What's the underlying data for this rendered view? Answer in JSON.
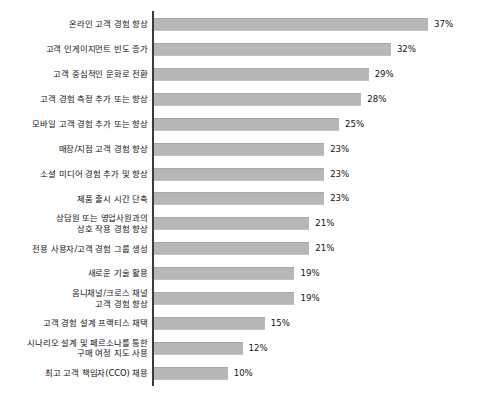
{
  "chart": {
    "title": "",
    "axis_color": "#3c3c3c",
    "bar_color": "#b7b7b7",
    "value_suffix": "%"
  },
  "chart_data": {
    "type": "bar",
    "orientation": "horizontal",
    "title": "",
    "subtitle": "",
    "xlabel": "",
    "ylabel": "",
    "xlim": [
      0,
      37
    ],
    "grid": false,
    "legend": false,
    "value_format": "{v}%",
    "categories": [
      "온라인 고객 경험 향상",
      "고객 인게이지먼트 빈도 증가",
      "고객 중심적인 문화로 전환",
      "고객 경험 측정 추가 또는 향상",
      "모바일 고객 경험 추가 또는 향상",
      "매장/지점 고객 경험 향상",
      "소셜 미디어 경험 추가 및 향상",
      "제품 출시 시간 단축",
      "상담원 또는 영업사원과의\n상호 작용 경험 향상",
      "전용 사용자/고객 경험 그룹 생성",
      "새로운 기술 활용",
      "옴니채널/크로스 채널\n고객 경험 향상",
      "고객 경험 설계 프랙티스 채택",
      "시나리오 설계 및 페르소나를 통한\n구매 여정 지도 사용",
      "최고 고객 책임자(CCO) 채용"
    ],
    "values": [
      37,
      32,
      29,
      28,
      25,
      23,
      23,
      23,
      21,
      21,
      19,
      19,
      15,
      12,
      10
    ],
    "value_labels": [
      "37%",
      "32%",
      "29%",
      "28%",
      "25%",
      "23%",
      "23%",
      "23%",
      "21%",
      "21%",
      "19%",
      "19%",
      "15%",
      "12%",
      "10%"
    ]
  },
  "rows": [
    {
      "label": "온라인 고객 경험 향상",
      "value": 37,
      "value_label": "37%"
    },
    {
      "label": "고객 인게이지먼트 빈도 증가",
      "value": 32,
      "value_label": "32%"
    },
    {
      "label": "고객 중심적인 문화로 전환",
      "value": 29,
      "value_label": "29%"
    },
    {
      "label": "고객 경험 측정 추가 또는 향상",
      "value": 28,
      "value_label": "28%"
    },
    {
      "label": "모바일 고객 경험 추가 또는 향상",
      "value": 25,
      "value_label": "25%"
    },
    {
      "label": "매장/지점 고객 경험 향상",
      "value": 23,
      "value_label": "23%"
    },
    {
      "label": "소셜 미디어 경험 추가 및 향상",
      "value": 23,
      "value_label": "23%"
    },
    {
      "label": "제품 출시 시간 단축",
      "value": 23,
      "value_label": "23%"
    },
    {
      "label": "상담원 또는 영업사원과의\n상호 작용 경험 향상",
      "value": 21,
      "value_label": "21%"
    },
    {
      "label": "전용 사용자/고객 경험 그룹 생성",
      "value": 21,
      "value_label": "21%"
    },
    {
      "label": "새로운 기술 활용",
      "value": 19,
      "value_label": "19%"
    },
    {
      "label": "옴니채널/크로스 채널\n고객 경험 향상",
      "value": 19,
      "value_label": "19%"
    },
    {
      "label": "고객 경험 설계 프랙티스 채택",
      "value": 15,
      "value_label": "15%"
    },
    {
      "label": "시나리오 설계 및 페르소나를 통한\n구매 여정 지도 사용",
      "value": 12,
      "value_label": "12%"
    },
    {
      "label": "최고 고객 책임자(CCO) 채용",
      "value": 10,
      "value_label": "10%"
    }
  ]
}
